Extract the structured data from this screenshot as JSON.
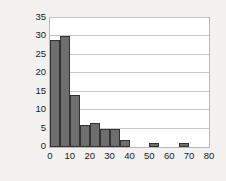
{
  "chart_data": {
    "type": "bar",
    "title": "",
    "subtitle": "",
    "xlabel": "",
    "ylabel": "Frequency",
    "xlim": [
      0,
      80
    ],
    "ylim": [
      0,
      35
    ],
    "xticks": [
      0,
      10,
      20,
      30,
      40,
      50,
      60,
      70,
      80
    ],
    "yticks": [
      0,
      5,
      10,
      15,
      20,
      25,
      30,
      35
    ],
    "grid": "horizontal",
    "legend": "none",
    "bin_width": 5,
    "bin_edges": [
      0,
      5,
      10,
      15,
      20,
      25,
      30,
      35,
      40,
      45,
      50,
      55,
      60,
      65,
      70
    ],
    "categories": [
      "0-5",
      "5-10",
      "10-15",
      "15-20",
      "20-25",
      "25-30",
      "30-35",
      "35-40",
      "40-45",
      "45-50",
      "50-55",
      "55-60",
      "60-65",
      "65-70"
    ],
    "values": [
      29,
      30,
      14,
      6,
      6.5,
      5,
      5,
      2,
      0,
      0,
      1,
      0,
      0,
      1
    ],
    "bar_color": "#6e6e6e",
    "bar_edge_color": "#333333",
    "plot_background": "#ffffff",
    "figure_background": "#f2f1ef",
    "gridline_color": "#c9c7c4",
    "frame_color": "#b9b7b4",
    "text_color": "#1a1a1a"
  }
}
